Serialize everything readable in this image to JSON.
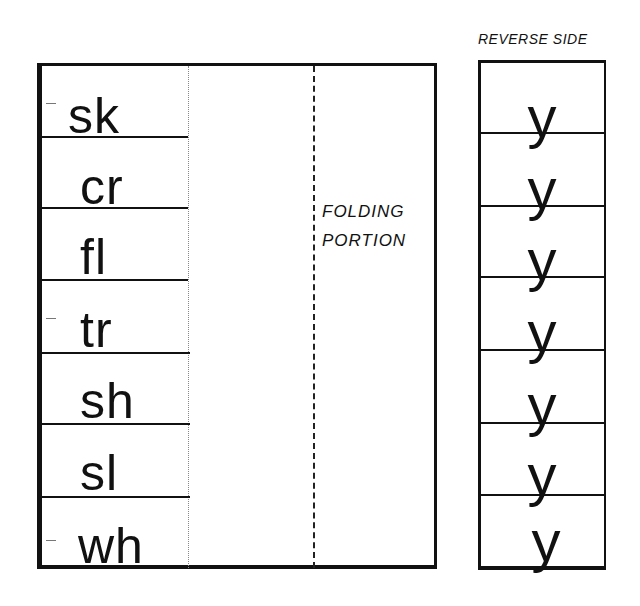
{
  "left_card": {
    "blends": [
      "sk",
      "cr",
      "fl",
      "tr",
      "sh",
      "sl",
      "wh"
    ],
    "folding_label_line1": "FOLDING",
    "folding_label_line2": "PORTION"
  },
  "right_card": {
    "title": "REVERSE SIDE",
    "letters": [
      "y",
      "y",
      "y",
      "y",
      "y",
      "y",
      "y"
    ]
  },
  "colors": {
    "ink": "#111111",
    "paper": "#ffffff"
  }
}
